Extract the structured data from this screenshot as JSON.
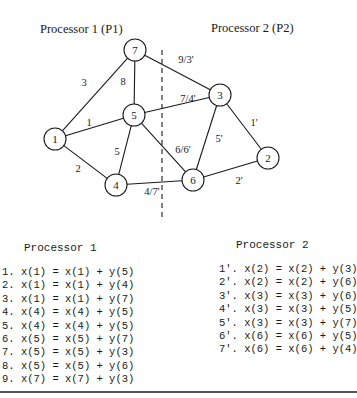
{
  "diagram": {
    "labels": {
      "p1": "Processor 1 (P1)",
      "p2": "Processor 2 (P2)"
    },
    "nodes": [
      {
        "id": "7",
        "label": "7",
        "x": 135,
        "y": 50
      },
      {
        "id": "5",
        "label": "5",
        "x": 134,
        "y": 115
      },
      {
        "id": "1",
        "label": "1",
        "x": 55,
        "y": 139
      },
      {
        "id": "4",
        "label": "4",
        "x": 116,
        "y": 185
      },
      {
        "id": "3",
        "label": "3",
        "x": 220,
        "y": 95
      },
      {
        "id": "6",
        "label": "6",
        "x": 193,
        "y": 180
      },
      {
        "id": "2",
        "label": "2",
        "x": 268,
        "y": 158
      }
    ],
    "edges": [
      {
        "from": "1",
        "to": "7",
        "label": "3",
        "lx": 84,
        "ly": 86
      },
      {
        "from": "7",
        "to": "5",
        "label": "8",
        "lx": 123,
        "ly": 85
      },
      {
        "from": "1",
        "to": "5",
        "label": "1",
        "lx": 89,
        "ly": 126
      },
      {
        "from": "1",
        "to": "4",
        "label": "2",
        "lx": 78,
        "ly": 172
      },
      {
        "from": "5",
        "to": "4",
        "label": "5",
        "lx": 117,
        "ly": 155
      },
      {
        "from": "7",
        "to": "3",
        "label": "9/3'",
        "lx": 186,
        "ly": 63
      },
      {
        "from": "5",
        "to": "3",
        "label": "7/4'",
        "lx": 188,
        "ly": 102
      },
      {
        "from": "5",
        "to": "6",
        "label": "6/6'",
        "lx": 183,
        "ly": 153
      },
      {
        "from": "4",
        "to": "6",
        "label": "4/7'",
        "lx": 152,
        "ly": 195
      },
      {
        "from": "3",
        "to": "6",
        "label": "5'",
        "lx": 219,
        "ly": 142
      },
      {
        "from": "3",
        "to": "2",
        "label": "1'",
        "lx": 254,
        "ly": 126
      },
      {
        "from": "6",
        "to": "2",
        "label": "2'",
        "lx": 239,
        "ly": 184
      }
    ],
    "partition_line": {
      "x": 162,
      "y1": 50,
      "y2": 220
    }
  },
  "processor1": {
    "title": "Processor 1",
    "lines": [
      "1. x(1) = x(1) + y(5)",
      "2. x(1) = x(1) + y(4)",
      "3. x(1) = x(1) + y(7)",
      "4. x(4) = x(4) + y(5)",
      "5. x(4) = x(4) + y(5)",
      "6. x(5) = x(5) + y(7)",
      "7. x(5) = x(5) + y(3)",
      "8. x(5) = x(5) + y(6)",
      "9. x(7) = x(7) + y(3)"
    ]
  },
  "processor2": {
    "title": "Processor 2",
    "lines": [
      "1'. x(2) = x(2) + y(3)",
      "2'. x(2) = x(2) + y(6)",
      "3'. x(3) = x(3) + y(6)",
      "4'. x(3) = x(3) + y(5)",
      "5'. x(3) = x(3) + y(7)",
      "6'. x(6) = x(6) + y(5)",
      "7'. x(6) = x(6) + y(4)"
    ]
  }
}
